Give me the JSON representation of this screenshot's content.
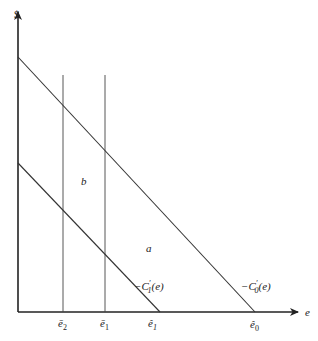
{
  "diagram": {
    "y_axis_label": "$",
    "x_axis_label": "e",
    "curves": [
      {
        "id": "c0",
        "label_prefix": "−C",
        "label_sub": "0",
        "label_prime": "′",
        "label_suffix": "(e)"
      },
      {
        "id": "c1",
        "label_prefix": "−C",
        "label_sub": "1",
        "label_prime": "′",
        "label_suffix": "(e)"
      }
    ],
    "regions": {
      "a": "a",
      "b": "b"
    },
    "x_ticks": [
      {
        "id": "ebar2",
        "base": "ē",
        "sub": "2"
      },
      {
        "id": "ebar1",
        "base": "ē",
        "sub": "1"
      },
      {
        "id": "ehat1",
        "base": "ê",
        "sub": "1"
      },
      {
        "id": "ehat0",
        "base": "ê",
        "sub": "0"
      }
    ],
    "colors": {
      "ink": "#222222",
      "background": "#ffffff"
    }
  }
}
